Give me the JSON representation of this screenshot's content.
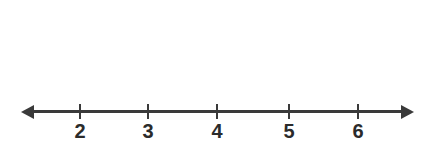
{
  "chart_data": {
    "type": "bar",
    "plot_style": "dot-plot",
    "title": "",
    "subtitle": "",
    "xlabel": "",
    "ylabel": "",
    "categories": [
      "2",
      "3",
      "4",
      "5",
      "6"
    ],
    "values": [
      2,
      4,
      6,
      4,
      2
    ],
    "tick_labels": [
      "2",
      "3",
      "4",
      "5",
      "6"
    ],
    "xlim": [
      1.3,
      6.8
    ],
    "ylim": [
      0,
      6
    ],
    "grid": false,
    "legend": null,
    "annotations": [],
    "dot_symbol": "filled-circle",
    "axis_has_arrows_both_ends": true,
    "colors": {
      "dot": "#2b2b2b",
      "axis": "#3a3a3a",
      "label": "#2b2b2b",
      "background": "#ffffff"
    }
  },
  "layout": {
    "axis_y": 110,
    "axis_left": 31,
    "axis_right": 404,
    "tick_x": [
      80,
      148,
      217,
      289,
      358
    ],
    "dot_diameter": 9,
    "dot_spacing": 17,
    "baseline_dot_y": 92
  }
}
